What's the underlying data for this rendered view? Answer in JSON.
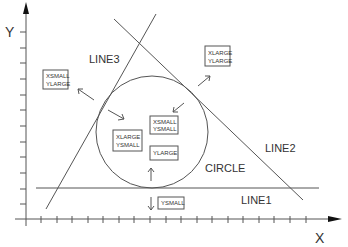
{
  "axes": {
    "x_label": "X",
    "y_label": "Y",
    "x_ticks": [
      41,
      57,
      72,
      88,
      103,
      119,
      134,
      150,
      166,
      181,
      197,
      212,
      228,
      243,
      259,
      274,
      290,
      306
    ],
    "y_ticks": [
      204,
      189,
      173,
      157,
      142,
      126,
      110,
      95,
      79,
      63,
      48,
      32
    ]
  },
  "shapes": {
    "line1": {
      "label": "LINE1"
    },
    "line2": {
      "label": "LINE2"
    },
    "line3": {
      "label": "LINE3"
    },
    "circle": {
      "label": "CIRCLE"
    }
  },
  "boxes": {
    "xsmall_ylarge": {
      "line1": "XSMALL",
      "line2": "YLARGE"
    },
    "xlarge_ylarge": {
      "line1": "XLARGE",
      "line2": "YLARGE"
    },
    "xsmall_ysmall": {
      "line1": "XSMALL",
      "line2": "YSMALL"
    },
    "xlarge_ysmall": {
      "line1": "XLARGE",
      "line2": "YSMALL"
    },
    "ylarge": {
      "line1": "YLARGE"
    },
    "ysmall": {
      "line1": "YSMALL"
    }
  },
  "colors": {
    "stroke": "#444444",
    "background": "#ffffff"
  }
}
